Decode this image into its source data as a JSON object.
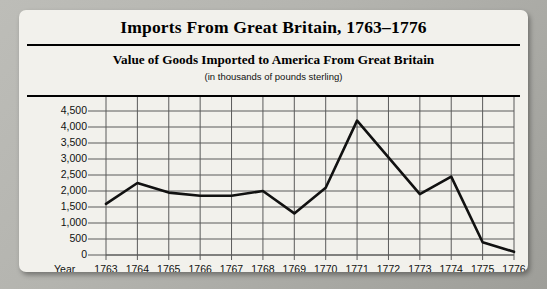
{
  "chart_title": "Imports From Great Britain, 1763–1776",
  "chart_subtitle": "Value of Goods Imported to America From Great Britain",
  "chart_units": "(in thousands of pounds sterling)",
  "axis_corner_label": "Year",
  "colors": {
    "frame": "#b4b4af",
    "card_background": "#f2f1ec",
    "ink": "#000000",
    "gridline": "#5a5a5a",
    "series_line": "#111111"
  },
  "chart_data": {
    "type": "line",
    "title": "Value of Goods Imported to America From Great Britain",
    "subtitle": "(in thousands of pounds sterling)",
    "xlabel": "Year",
    "ylabel": "",
    "grid": true,
    "legend": "none",
    "ylim": [
      0,
      4500
    ],
    "yticks": [
      0,
      500,
      1000,
      1500,
      2000,
      2500,
      3000,
      3500,
      4000,
      4500
    ],
    "ytick_labels": [
      "0",
      "500",
      "1,000",
      "1,500",
      "2,000",
      "2,500",
      "3,000",
      "3,500",
      "4,000",
      "4,500"
    ],
    "categories": [
      1763,
      1764,
      1765,
      1766,
      1767,
      1768,
      1769,
      1770,
      1771,
      1772,
      1773,
      1774,
      1775,
      1776
    ],
    "xtick_labels": [
      "1763",
      "1764",
      "1765",
      "1766",
      "1767",
      "1768",
      "1769",
      "1770",
      "1771",
      "1772",
      "1773",
      "1774",
      "1775",
      "1776"
    ],
    "values": [
      1600,
      2250,
      1950,
      1850,
      1850,
      2000,
      1300,
      2100,
      4200,
      3050,
      1900,
      2450,
      400,
      100
    ]
  }
}
